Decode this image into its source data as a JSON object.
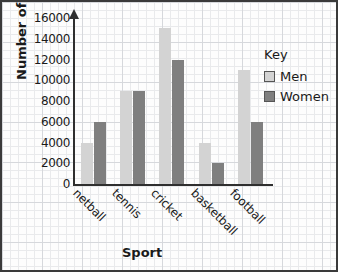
{
  "chart_data": {
    "type": "bar",
    "title": "",
    "xlabel": "Sport",
    "ylabel": "Number of adults",
    "categories": [
      "netball",
      "tennis",
      "cricket",
      "basketball",
      "football"
    ],
    "series": [
      {
        "name": "Men",
        "values": [
          4000,
          9000,
          15000,
          4000,
          11000
        ],
        "color": "#d3d3d3"
      },
      {
        "name": "Women",
        "values": [
          6000,
          9000,
          12000,
          2000,
          6000
        ],
        "color": "#7f7f7f"
      }
    ],
    "ylim": [
      0,
      16000
    ],
    "yticks": [
      0,
      2000,
      4000,
      6000,
      8000,
      10000,
      12000,
      14000,
      16000
    ],
    "ytick_labels": [
      "0",
      "2000",
      "4000",
      "6000",
      "8000",
      "10000",
      "12000",
      "14000",
      "16000"
    ],
    "grid": true,
    "legend_position": "right",
    "legend_title": "Key"
  },
  "legend": {
    "title": "Key",
    "entries": [
      {
        "label": "Men"
      },
      {
        "label": "Women"
      }
    ]
  },
  "axes": {
    "y_title": "Number of adults",
    "x_title": "Sport"
  }
}
